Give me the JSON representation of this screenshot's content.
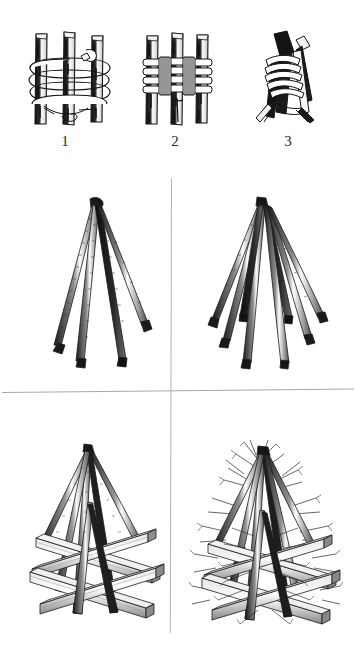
{
  "page": {
    "background_color": "#ffffff",
    "ink_color": "#1a1a1a",
    "rule_color": "#a8a8a8",
    "width": 355,
    "height": 645
  },
  "steps": [
    {
      "number": "1",
      "name": "figure-three-poles-open-lashing",
      "caption": "Three parallel poles bound with loose wrapping turns of rope, running end hanging free"
    },
    {
      "number": "2",
      "name": "figure-three-poles-frapping-turns",
      "caption": "Same three poles with frapping turns pulled tight between the poles"
    },
    {
      "number": "3",
      "name": "figure-poles-splayed-tripod-head",
      "caption": "Poles splayed apart to form the tripod head, lashing locking the crossing"
    }
  ],
  "panels": [
    {
      "name": "panel-tripod-four-legs",
      "position": "top-left",
      "caption": "Lashed poles opened out into a four-legged standing tripod frame"
    },
    {
      "name": "panel-tripod-eight-legs",
      "position": "top-right",
      "caption": "Additional poles added around the apex to widen the cone frame"
    },
    {
      "name": "panel-pyre-with-log-cribbing",
      "position": "bottom-left",
      "caption": "Cone frame set over a square log crib base of stacked timbers"
    },
    {
      "name": "panel-pyre-packed-with-brush",
      "position": "bottom-right",
      "caption": "Completed structure packed with brushwood and kindling ready to burn"
    }
  ],
  "dividers": {
    "horizontal_label": "horizontal-rule",
    "vertical_label": "vertical-rule"
  }
}
